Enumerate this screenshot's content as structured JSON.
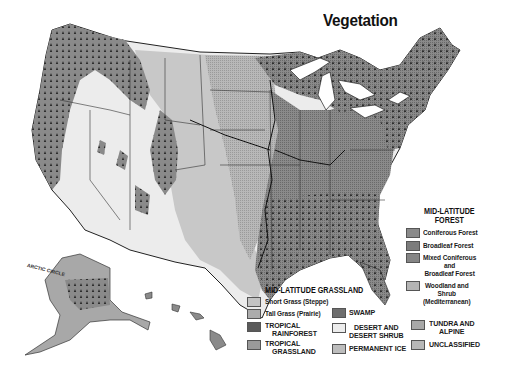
{
  "title": "Vegetation",
  "map": {
    "region": "United States",
    "insets": [
      "Alaska",
      "Hawaii"
    ],
    "label_arctic_circle": "ARCTIC CIRCLE"
  },
  "legend": {
    "forest": {
      "heading": "MID-LATITUDE FOREST",
      "heading_line1": "MID-LATITUDE",
      "heading_line2": "FOREST",
      "items": [
        {
          "label": "Coniferous Forest",
          "swatch": "#8a8a8a",
          "pattern": "tree-dots"
        },
        {
          "label": "Broadleaf Forest",
          "swatch": "#7c7c7c",
          "pattern": "fine-dots"
        },
        {
          "label_line1": "Mixed Coniferous",
          "label_line2": "and",
          "label_line3": "Broadleaf Forest",
          "swatch": "#858585",
          "pattern": "tree-dots-fine"
        },
        {
          "label_line1": "Woodland and",
          "label_line2": "Shrub",
          "label_line3": "(Mediterranean)",
          "swatch": "#b4b4b4",
          "pattern": "solid"
        }
      ]
    },
    "grassland": {
      "heading": "MID-LATITUDE GRASSLAND",
      "items": [
        {
          "label": "Short Grass (Steppe)",
          "swatch": "#c4c4c4"
        },
        {
          "label": "Tall Grass (Prairie)",
          "swatch": "#acacac"
        }
      ]
    },
    "other": [
      {
        "label_line1": "TROPICAL",
        "label_line2": "RAINFOREST",
        "swatch": "#5a5a5a"
      },
      {
        "label_line1": "TROPICAL",
        "label_line2": "GRASSLAND",
        "swatch": "#9a9a9a"
      },
      {
        "label": "SWAMP",
        "swatch": "#6e6e6e"
      },
      {
        "label_line1": "DESERT AND",
        "label_line2": "DESERT SHRUB",
        "swatch": "#ececec"
      },
      {
        "label": "PERMANENT ICE",
        "swatch": "#bdbdbd"
      },
      {
        "label_line1": "TUNDRA AND",
        "label_line2": "ALPINE",
        "swatch": "#a8a8a8"
      },
      {
        "label": "UNCLASSIFIED",
        "swatch": "#b8b8b8"
      }
    ]
  },
  "colors": {
    "background": "#ffffff",
    "desert": "#ececec",
    "short_grass": "#c8c8c8",
    "tall_grass": "#b2b2b2",
    "broadleaf": "#808080",
    "coniferous": "#8e8e8e",
    "borders": "#222222"
  }
}
